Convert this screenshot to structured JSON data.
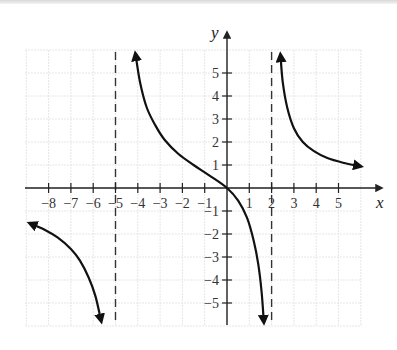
{
  "chart_data": {
    "type": "line",
    "title": "",
    "xlabel": "x",
    "ylabel": "y",
    "xlim": [
      -9,
      6
    ],
    "ylim": [
      -6,
      6
    ],
    "grid": true,
    "x_ticks": [
      -8,
      -7,
      -6,
      -5,
      -4,
      -3,
      -2,
      -1,
      1,
      2,
      3,
      4,
      5
    ],
    "y_ticks": [
      5,
      4,
      3,
      2,
      1,
      -1,
      -2,
      -3,
      -4,
      -5
    ],
    "x_tick_labels": [
      "−8",
      "−7",
      "−6",
      "−5",
      "−4",
      "−3",
      "−2",
      "−1",
      "1",
      "2",
      "3",
      "4",
      "5"
    ],
    "y_tick_labels": [
      "5",
      "4",
      "3",
      "2",
      "1",
      "−1",
      "−2",
      "−3",
      "−4",
      "−5"
    ],
    "vertical_asymptotes": [
      -5,
      2
    ],
    "series": [
      {
        "name": "left-branch",
        "arrows": "both",
        "points": [
          [
            -8.8,
            -1.55
          ],
          [
            -8.2,
            -1.8
          ],
          [
            -7.6,
            -2.15
          ],
          [
            -7.0,
            -2.65
          ],
          [
            -6.6,
            -3.15
          ],
          [
            -6.2,
            -3.9
          ],
          [
            -5.9,
            -4.7
          ],
          [
            -5.65,
            -5.75
          ]
        ]
      },
      {
        "name": "middle-branch",
        "arrows": "both",
        "points": [
          [
            -4.1,
            5.8
          ],
          [
            -3.9,
            4.6
          ],
          [
            -3.6,
            3.5
          ],
          [
            -3.2,
            2.7
          ],
          [
            -2.8,
            2.1
          ],
          [
            -2.2,
            1.5
          ],
          [
            -1.5,
            1.0
          ],
          [
            -0.8,
            0.55
          ],
          [
            0,
            0
          ],
          [
            0.5,
            -0.55
          ],
          [
            0.9,
            -1.3
          ],
          [
            1.2,
            -2.3
          ],
          [
            1.4,
            -3.3
          ],
          [
            1.55,
            -4.5
          ],
          [
            1.65,
            -5.8
          ]
        ]
      },
      {
        "name": "right-branch",
        "arrows": "both",
        "points": [
          [
            2.4,
            5.75
          ],
          [
            2.5,
            4.6
          ],
          [
            2.7,
            3.5
          ],
          [
            3.0,
            2.6
          ],
          [
            3.4,
            2.0
          ],
          [
            3.9,
            1.6
          ],
          [
            4.5,
            1.3
          ],
          [
            5.2,
            1.1
          ],
          [
            5.95,
            0.95
          ]
        ]
      }
    ]
  },
  "layout": {
    "origin_px": [
      227,
      188
    ],
    "x_unit_px": 22.3,
    "y_unit_px": 23,
    "grid_px": {
      "x0": 25,
      "x1": 362,
      "y0": 50,
      "y1": 325
    },
    "x_axis_end_px": 382,
    "y_axis_top_px": 32,
    "y_axis_bottom_px": 325
  },
  "colors": {
    "curve": "#111111",
    "axis": "#222222",
    "grid": "#e6e6e6",
    "asymptote": "#333333",
    "text": "#333333"
  }
}
